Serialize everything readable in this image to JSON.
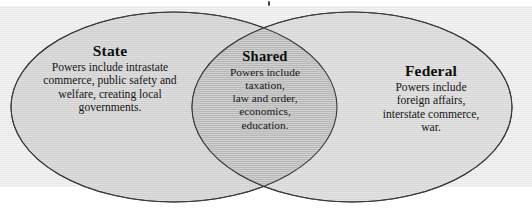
{
  "diagram": {
    "type": "venn",
    "kind": "two-set-venn-diagram",
    "sets": [
      {
        "id": "state",
        "title": "State",
        "body": "Powers include intrastate commerce, public safety and welfare, creating local governments.",
        "items": [
          "intrastate commerce",
          "public safety and welfare",
          "creating local governments"
        ],
        "position": "left",
        "fill_color": "#d0d0d0",
        "stroke_color": "#3a3a3a"
      },
      {
        "id": "shared",
        "title": "Shared",
        "body": "Powers include taxation, law and order, economics, education.",
        "items": [
          "taxation",
          "law and order",
          "economics",
          "education"
        ],
        "position": "center-overlap",
        "fill_color": "#bcbcbc",
        "stroke_color": "#3a3a3a"
      },
      {
        "id": "federal",
        "title": "Federal",
        "body": "Powers include foreign affairs, interstate commerce, war.",
        "items": [
          "foreign affairs",
          "interstate commerce",
          "war"
        ],
        "position": "right",
        "fill_color": "#d4d4d4",
        "stroke_color": "#3a3a3a"
      }
    ],
    "text_lines": {
      "state": [
        "Powers include intrastate",
        "commerce, public safety and",
        "welfare, creating local",
        "governments."
      ],
      "shared": [
        "Powers include",
        "taxation,",
        "law and order,",
        "economics,",
        "education."
      ],
      "federal": [
        "Powers include",
        "foreign affairs,",
        "interstate commerce,",
        "war."
      ]
    },
    "colors": {
      "background": "#ffffff",
      "band": "#e7e7e7",
      "left_fill": "#d0d0d0",
      "right_fill": "#d4d4d4",
      "overlap_fill": "#bcbcbc",
      "outline": "#3a3a3a",
      "text": "#111111"
    },
    "geometry": {
      "left_ellipse": {
        "cx": 174,
        "cy": 107,
        "rx": 163,
        "ry": 95
      },
      "right_ellipse": {
        "cx": 352,
        "cy": 107,
        "rx": 160,
        "ry": 95
      },
      "intersection_points": [
        {
          "x": 266,
          "y": 14
        },
        {
          "x": 266,
          "y": 193
        }
      ]
    }
  }
}
